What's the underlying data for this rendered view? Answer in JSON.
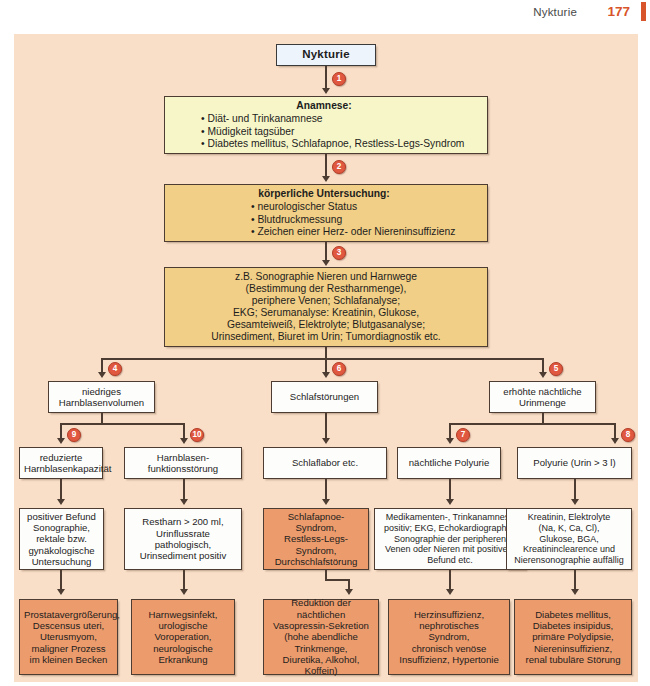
{
  "header": {
    "title": "Nykturie",
    "page_number": "177"
  },
  "diagram": {
    "title_node": "Nykturie",
    "anamnese": {
      "heading": "Anamnese:",
      "items": [
        "• Diät- und Trinkanamnese",
        "• Müdigkeit tagsüber",
        "• Diabetes mellitus, Schlafapnoe, Restless-Legs-Syndrom"
      ]
    },
    "untersuchung": {
      "heading": "körperliche Untersuchung:",
      "items": [
        "• neurologischer Status",
        "• Blutdruckmessung",
        "• Zeichen einer Herz- oder Niereninsuffizienz"
      ]
    },
    "diagnostik": {
      "lines": [
        "z.B. Sonographie Nieren und Harnwege",
        "(Bestimmung der Restharnmenge),",
        "periphere Venen; Schlafanalyse;",
        "EKG; Serumanalyse: Kreatinin, Glukose,",
        "Gesamteiweiß, Elektrolyte; Blutgasanalyse;",
        "Urinsediment, Biuret im Urin; Tumordiagnostik etc."
      ]
    },
    "branches": [
      {
        "lines": [
          "niedriges",
          "Harnblasenvolumen"
        ]
      },
      {
        "lines": [
          "Schlafstörungen"
        ]
      },
      {
        "lines": [
          "erhöhte nächtliche",
          "Urinmenge"
        ]
      }
    ],
    "subbranches": [
      {
        "lines": [
          "reduzierte",
          "Harnblasenkapazität"
        ]
      },
      {
        "lines": [
          "Harnblasen-",
          "funktionsstörung"
        ]
      },
      {
        "lines": [
          "Schlaflabor etc."
        ]
      },
      {
        "lines": [
          "nächtliche Polyurie"
        ]
      },
      {
        "lines": [
          "Polyurie (Urin > 3 l)"
        ]
      }
    ],
    "findings": [
      {
        "lines": [
          "positiver Befund",
          "Sonographie,",
          "rektale bzw.",
          "gynäkologische",
          "Untersuchung"
        ]
      },
      {
        "lines": [
          "Restharn > 200 ml,",
          "Urinflussrate",
          "pathologisch,",
          "Urinsediment positiv"
        ]
      },
      {
        "lines": [
          "Schlafapnoe-",
          "Syndrom,",
          "Restless-Legs-",
          "Syndrom,",
          "Durchschlafstörung"
        ]
      },
      {
        "lines": [
          "Medikamenten-, Trinkanamnese",
          "positiv; EKG, Echokardiographie,",
          "Sonographie der peripheren",
          "Venen oder Nieren mit positivem",
          "Befund etc."
        ]
      },
      {
        "lines": [
          "Kreatinin, Elektrolyte",
          "(Na, K, Ca, Cl),",
          "Glukose, BGA,",
          "Kreatininclearence und",
          "Nierensonographie auffällig"
        ]
      }
    ],
    "diagnoses": [
      {
        "lines": [
          "Prostatavergrößerung,",
          "Descensus uteri,",
          "Uterusmyom,",
          "maligner Prozess",
          "im kleinen Becken"
        ]
      },
      {
        "lines": [
          "Harnwegsinfekt,",
          "urologische",
          "Voroperation,",
          "neurologische",
          "Erkrankung"
        ]
      },
      {
        "lines": [
          "Reduktion der",
          "nächtlichen",
          "Vasopressin-Sekretion",
          "(hohe abendliche",
          "Trinkmenge,",
          "Diuretika, Alkohol,",
          "Koffein)"
        ]
      },
      {
        "lines": [
          "Herzinsuffizienz,",
          "nephrotisches",
          "Syndrom,",
          "chronisch venöse",
          "Insuffizienz, Hypertonie"
        ]
      },
      {
        "lines": [
          "Diabetes mellitus,",
          "Diabetes insipidus,",
          "primäre Polydipsie,",
          "Niereninsuffizienz,",
          "renal tubuläre Störung"
        ]
      }
    ],
    "markers": [
      "1",
      "2",
      "3",
      "4",
      "5",
      "6",
      "7",
      "8",
      "9",
      "10"
    ]
  },
  "colors": {
    "accent": "#d8542a",
    "marker": "#e0583f",
    "canvas_bg": "#fadfc8",
    "salmon_box": "#ec9b6c",
    "yellow_light": "#f7f6c8",
    "yellow_dark": "#f2cf86",
    "title_box": "#eef4fb",
    "line": "#4c3c32"
  }
}
